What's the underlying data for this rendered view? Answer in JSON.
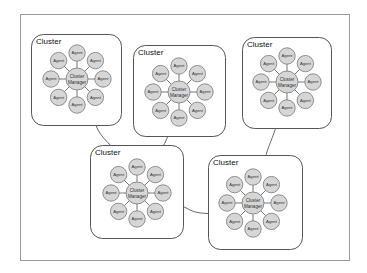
{
  "diagram": {
    "frame": {
      "x": 20,
      "y": 14,
      "w": 330,
      "h": 247
    },
    "agent_label": "Agent",
    "manager_label_line1": "Cluster",
    "manager_label_line2": "Manager",
    "colors": {
      "node_fill": "#d6d6d6",
      "node_stroke": "#777777",
      "box_stroke": "#555555",
      "link": "#444444"
    },
    "clusters": [
      {
        "id": "cluster-1",
        "label": "Cluster",
        "box": {
          "x": 31,
          "y": 34,
          "w": 90,
          "h": 91
        },
        "manager": {
          "cx": 77,
          "cy": 79
        }
      },
      {
        "id": "cluster-2",
        "label": "Cluster",
        "box": {
          "x": 133,
          "y": 45,
          "w": 92,
          "h": 91
        },
        "manager": {
          "cx": 179,
          "cy": 92
        }
      },
      {
        "id": "cluster-3",
        "label": "Cluster",
        "box": {
          "x": 242,
          "y": 37,
          "w": 89,
          "h": 91
        },
        "manager": {
          "cx": 287,
          "cy": 82
        }
      },
      {
        "id": "cluster-4",
        "label": "Cluster",
        "box": {
          "x": 90,
          "y": 145,
          "w": 93,
          "h": 93
        },
        "manager": {
          "cx": 137,
          "cy": 193
        }
      },
      {
        "id": "cluster-5",
        "label": "Cluster",
        "box": {
          "x": 208,
          "y": 155,
          "w": 94,
          "h": 94
        },
        "manager": {
          "cx": 253,
          "cy": 203
        }
      }
    ],
    "agents_per_cluster": 8,
    "connections": [
      {
        "from": "cluster-1",
        "to": "cluster-4"
      },
      {
        "from": "cluster-2",
        "to": "cluster-4"
      },
      {
        "from": "cluster-3",
        "to": "cluster-5"
      },
      {
        "from": "cluster-4",
        "to": "cluster-5"
      }
    ]
  }
}
